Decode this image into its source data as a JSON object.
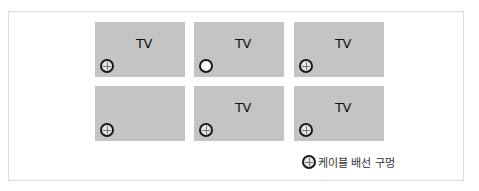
{
  "panels": [
    {
      "label": "TV",
      "hole": "cross"
    },
    {
      "label": "TV",
      "hole": "plain"
    },
    {
      "label": "TV",
      "hole": "cross"
    },
    {
      "label": "",
      "hole": "cross"
    },
    {
      "label": "TV",
      "hole": "cross"
    },
    {
      "label": "TV",
      "hole": "cross"
    }
  ],
  "legend": {
    "icon": "cable-hole-icon",
    "label": "케이블 배선 구멍"
  },
  "colors": {
    "panel": "#c4c4c4",
    "hole_ring": "#1a1a1a",
    "frame_border": "#dcdcdc"
  }
}
